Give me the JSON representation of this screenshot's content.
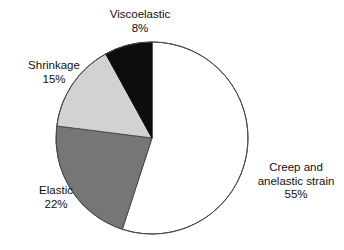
{
  "chart_data": {
    "type": "pie",
    "title": "",
    "labels": [
      "Creep and anelastic strain",
      "Elastic",
      "Shrinkage",
      "Viscoelastic"
    ],
    "values": [
      55,
      22,
      15,
      8
    ],
    "value_suffix": "%",
    "slices": [
      {
        "name": "Creep and anelastic strain",
        "label_line1": "Creep and",
        "label_line2": "anelastic strain",
        "value": 55,
        "value_text": "55%",
        "color": "#ffffff",
        "stroke": "#4a4a4a",
        "start_angle_deg": 0,
        "end_angle_deg": 198
      },
      {
        "name": "Elastic",
        "label_line1": "Elastic",
        "label_line2": "",
        "value": 22,
        "value_text": "22%",
        "color": "#767676",
        "stroke": "#4a4a4a",
        "start_angle_deg": 198,
        "end_angle_deg": 277.2
      },
      {
        "name": "Shrinkage",
        "label_line1": "Shrinkage",
        "label_line2": "",
        "value": 15,
        "value_text": "15%",
        "color": "#d2d2d2",
        "stroke": "#4a4a4a",
        "start_angle_deg": 277.2,
        "end_angle_deg": 331.2
      },
      {
        "name": "Viscoelastic",
        "label_line1": "Viscoelastic",
        "label_line2": "",
        "value": 8,
        "value_text": "8%",
        "color": "#0d0d0d",
        "stroke": "#0d0d0d",
        "start_angle_deg": 331.2,
        "end_angle_deg": 360
      }
    ],
    "geometry": {
      "center_x": 152,
      "center_y": 138,
      "radius": 96,
      "start_at_12_oclock": true,
      "direction": "clockwise"
    },
    "legend": "none",
    "grid": false,
    "xlabel": "",
    "ylabel": ""
  }
}
